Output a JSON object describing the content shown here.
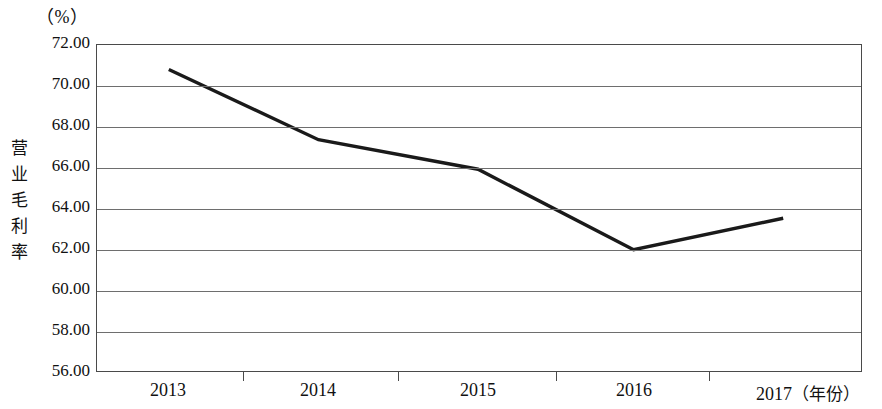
{
  "chart_data": {
    "type": "line",
    "title": "",
    "subtitle": "",
    "unit_label": "（%）",
    "ylabel": "营业毛利率",
    "xlabel": "（年份）",
    "categories": [
      "2013",
      "2014",
      "2015",
      "2016",
      "2017"
    ],
    "series": [
      {
        "name": "营业毛利率",
        "values": [
          70.8,
          67.35,
          65.9,
          61.95,
          63.5
        ],
        "color": "#1a1a1a"
      }
    ],
    "ylim": [
      56.0,
      72.0
    ],
    "ytick_labels": [
      "72.00",
      "70.00",
      "68.00",
      "66.00",
      "64.00",
      "62.00",
      "60.00",
      "58.00",
      "56.00"
    ],
    "ytick_values": [
      72.0,
      70.0,
      68.0,
      66.0,
      64.0,
      62.0,
      60.0,
      58.0,
      56.0
    ],
    "grid": "horizontal",
    "legend": "none",
    "frame_color": "#4a4a4a",
    "grid_color": "#6e6e6e"
  },
  "axis": {
    "x_last_label_suffix": "（年份）"
  }
}
